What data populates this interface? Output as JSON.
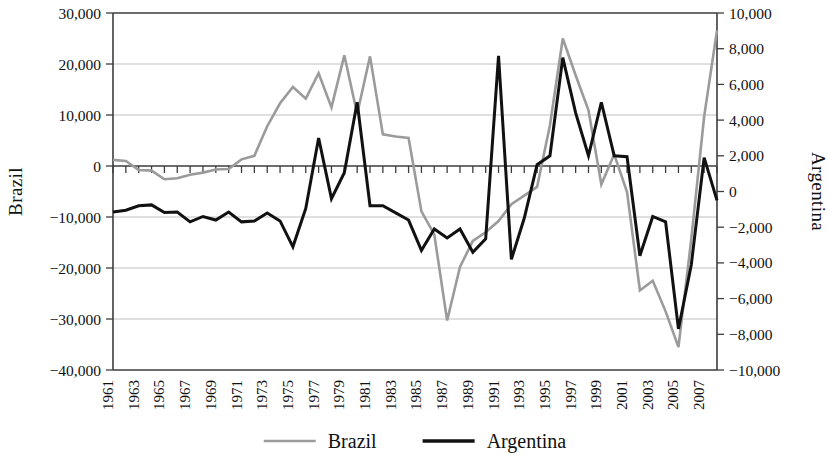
{
  "chart_data": {
    "type": "line",
    "title": "",
    "xlabel": "",
    "ylabel": "Brazil",
    "y2label": "Argentina",
    "grid": true,
    "legend_position": "bottom",
    "x": [
      1961,
      1962,
      1963,
      1964,
      1965,
      1966,
      1967,
      1968,
      1969,
      1970,
      1971,
      1972,
      1973,
      1974,
      1975,
      1976,
      1977,
      1978,
      1979,
      1980,
      1981,
      1982,
      1983,
      1984,
      1985,
      1986,
      1987,
      1988,
      1989,
      1990,
      1991,
      1992,
      1993,
      1994,
      1995,
      1996,
      1997,
      1998,
      1999,
      2000,
      2001,
      2002,
      2003,
      2004,
      2005,
      2006,
      2007,
      2008
    ],
    "xtick_labels": [
      "1961",
      "1963",
      "1965",
      "1967",
      "1969",
      "1971",
      "1973",
      "1975",
      "1977",
      "1979",
      "1981",
      "1983",
      "1985",
      "1987",
      "1989",
      "1991",
      "1993",
      "1995",
      "1997",
      "1999",
      "2001",
      "2003",
      "2005",
      "2007"
    ],
    "xtick_values": [
      1961,
      1963,
      1965,
      1967,
      1969,
      1971,
      1973,
      1975,
      1977,
      1979,
      1981,
      1983,
      1985,
      1987,
      1989,
      1991,
      1993,
      1995,
      1997,
      1999,
      2001,
      2003,
      2005,
      2007
    ],
    "xlim": [
      1961,
      2008
    ],
    "ylim": [
      -40000,
      30000
    ],
    "ytick_labels": [
      "30,000",
      "20,000",
      "10,000",
      "0",
      "-10,000",
      "-20,000",
      "-30,000",
      "-40,000"
    ],
    "ytick_values": [
      30000,
      20000,
      10000,
      0,
      -10000,
      -20000,
      -30000,
      -40000
    ],
    "y2lim": [
      -10000,
      10000
    ],
    "y2tick_labels": [
      "10,000",
      "8,000",
      "6,000",
      "4,000",
      "2,000",
      "0",
      "-2,000",
      "-4,000",
      "-6,000",
      "-8,000",
      "-10,000"
    ],
    "y2tick_values": [
      10000,
      8000,
      6000,
      4000,
      2000,
      0,
      -2000,
      -4000,
      -6000,
      -8000,
      -10000
    ],
    "series": [
      {
        "name": "Brazil",
        "axis": "left",
        "color": "#9b9b9b",
        "width": 2.6,
        "values": [
          1200,
          1000,
          -800,
          -900,
          -2600,
          -2400,
          -1700,
          -1300,
          -700,
          -600,
          1300,
          2000,
          7800,
          12300,
          15500,
          13200,
          18200,
          11500,
          21700,
          10200,
          21500,
          6200,
          5800,
          5500,
          -8900,
          -13400,
          -30300,
          -19800,
          -14700,
          -13000,
          -10800,
          -7500,
          -5800,
          -4100,
          8000,
          25000,
          17800,
          10900,
          -3600,
          2300,
          -5100,
          -24400,
          -22500,
          -28500,
          -35500,
          -14300,
          9700,
          26600
        ]
      },
      {
        "name": "Argentina",
        "axis": "right",
        "color": "#111111",
        "width": 3.0,
        "values": [
          -1150,
          -1050,
          -800,
          -750,
          -1180,
          -1150,
          -1700,
          -1400,
          -1600,
          -1150,
          -1700,
          -1650,
          -1200,
          -1650,
          -3100,
          -950,
          3000,
          -400,
          1050,
          5000,
          -800,
          -800,
          -1200,
          -1600,
          -3300,
          -2100,
          -2600,
          -2100,
          -3400,
          -2650,
          7600,
          -3800,
          -1500,
          1500,
          2000,
          7500,
          4400,
          2000,
          5000,
          2000,
          1950,
          -3600,
          -1400,
          -1700,
          -7700,
          -4100,
          1900,
          -500
        ]
      }
    ]
  },
  "legend": {
    "items": [
      {
        "label": "Brazil",
        "color": "#9b9b9b",
        "style": "thin"
      },
      {
        "label": "Argentina",
        "color": "#111111",
        "style": "thick"
      }
    ]
  }
}
